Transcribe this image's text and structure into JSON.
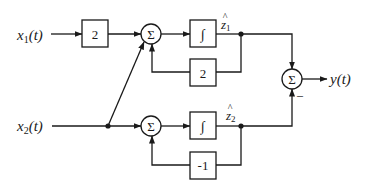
{
  "diagram": {
    "inputs": [
      {
        "id": "x1",
        "label": "x",
        "sub": "1",
        "suffix": "(t)"
      },
      {
        "id": "x2",
        "label": "x",
        "sub": "2",
        "suffix": "(t)"
      }
    ],
    "output": {
      "id": "y",
      "label": "y(t)"
    },
    "blocks": {
      "gain_x1": {
        "label": "2"
      },
      "integrator1": {
        "label": "∫"
      },
      "feedback1": {
        "label": "2"
      },
      "integrator2": {
        "label": "∫"
      },
      "feedback2": {
        "label": "-1"
      }
    },
    "summers": {
      "sum1": {
        "label": "Σ"
      },
      "sum2": {
        "label": "Σ"
      },
      "sum3": {
        "label": "Σ",
        "minus_sign": "–"
      }
    },
    "states": [
      {
        "id": "z1",
        "label": "z",
        "sub": "1",
        "hat": "^"
      },
      {
        "id": "z2",
        "label": "z",
        "sub": "2",
        "hat": "^"
      }
    ]
  }
}
